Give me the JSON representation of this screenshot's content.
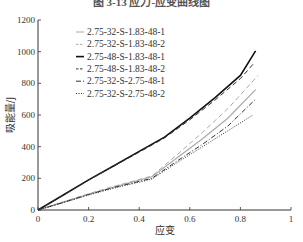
{
  "figure_title": "图 3-13 应力-应变曲线图",
  "chart_data": {
    "type": "line",
    "title": "图 3-13 应力-应变曲线图",
    "xlabel": "应变",
    "ylabel": "吸能量/J",
    "xlim": [
      0,
      1
    ],
    "ylim": [
      0,
      1200
    ],
    "xticks": [
      "0",
      "0.2",
      "0.4",
      "0.6",
      "0.8",
      "1"
    ],
    "yticks": [
      "0",
      "200",
      "400",
      "600",
      "800",
      "1000",
      "1200"
    ],
    "grid": false,
    "legend_position": "upper left",
    "series": [
      {
        "name": "2.75-32-S-1.83-48-1",
        "style": "solid",
        "color": "#aaaaaa",
        "x": [
          0,
          0.1,
          0.2,
          0.3,
          0.45,
          0.55,
          0.65,
          0.75,
          0.86
        ],
        "y": [
          0,
          50,
          100,
          145,
          210,
          330,
          450,
          580,
          760
        ]
      },
      {
        "name": "2.75-32-S-1.83-48-2",
        "style": "dashed",
        "color": "#aaaaaa",
        "x": [
          0,
          0.1,
          0.2,
          0.3,
          0.45,
          0.55,
          0.65,
          0.75,
          0.87
        ],
        "y": [
          0,
          52,
          103,
          150,
          215,
          350,
          490,
          640,
          850
        ]
      },
      {
        "name": "2.75-48-S-1.83-48-1",
        "style": "solid",
        "color": "#111111",
        "x": [
          0,
          0.1,
          0.2,
          0.3,
          0.4,
          0.5,
          0.6,
          0.7,
          0.8,
          0.86
        ],
        "y": [
          0,
          95,
          190,
          280,
          370,
          460,
          580,
          710,
          850,
          1005
        ]
      },
      {
        "name": "2.75-48-S-1.83-48-2",
        "style": "dashed",
        "color": "#333333",
        "x": [
          0,
          0.1,
          0.2,
          0.3,
          0.4,
          0.5,
          0.6,
          0.7,
          0.8,
          0.85
        ],
        "y": [
          0,
          93,
          188,
          278,
          365,
          455,
          570,
          695,
          830,
          920
        ]
      },
      {
        "name": "2.75-32-S-2.75-48-1",
        "style": "dashdot",
        "color": "#333333",
        "x": [
          0,
          0.1,
          0.2,
          0.3,
          0.45,
          0.55,
          0.65,
          0.75,
          0.86
        ],
        "y": [
          0,
          48,
          98,
          142,
          200,
          310,
          415,
          530,
          700
        ]
      },
      {
        "name": "2.75-32-S-2.75-48-2",
        "style": "dotted",
        "color": "#333333",
        "x": [
          0,
          0.1,
          0.2,
          0.3,
          0.45,
          0.55,
          0.65,
          0.75,
          0.85
        ],
        "y": [
          0,
          46,
          95,
          138,
          195,
          300,
          400,
          500,
          600
        ]
      }
    ]
  }
}
